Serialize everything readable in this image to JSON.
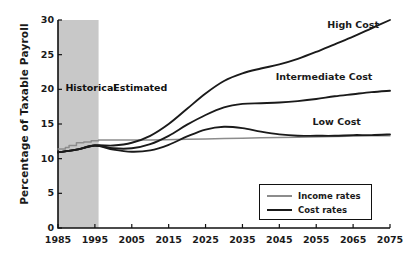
{
  "chart_data": {
    "type": "line",
    "title": "",
    "xlabel": "",
    "ylabel": "Percentage of Taxable Payroll",
    "xlim": [
      1985,
      2075
    ],
    "ylim": [
      0,
      30
    ],
    "grid": false,
    "legend_position": "bottom-right",
    "y_ticks": [
      0,
      5,
      10,
      15,
      20,
      25,
      30
    ],
    "y_tick_labels": [
      "0",
      "5",
      "10",
      "15",
      "20",
      "25",
      "30"
    ],
    "x_ticks": [
      1985,
      1995,
      2005,
      2015,
      2025,
      2035,
      2045,
      2055,
      2065,
      2075
    ],
    "x_tick_labels": [
      "1985",
      "1995",
      "2005",
      "2015",
      "2025",
      "2035",
      "2045",
      "2055",
      "2065",
      "2075"
    ],
    "annotations": [
      {
        "text": "Historical",
        "x": 1987,
        "y": 20.2
      },
      {
        "text": "Estimated",
        "x": 2000,
        "y": 20.2
      },
      {
        "text": "High Cost",
        "x": 2058,
        "y": 29.3
      },
      {
        "text": "Intermediate Cost",
        "x": 2044,
        "y": 21.8
      },
      {
        "text": "Low Cost",
        "x": 2054,
        "y": 15.3
      }
    ],
    "shaded_region": {
      "label": "Historical",
      "x_start": 1985,
      "x_end": 1996,
      "color": "#c8c8c8"
    },
    "series": [
      {
        "name": "Income rates",
        "color": "#8c8c8c",
        "x": [
          1985,
          1986,
          1987,
          1988,
          1989,
          1990,
          1991,
          1992,
          1993,
          1994,
          1995,
          1996,
          2000,
          2010,
          2020,
          2030,
          2040,
          2050,
          2060,
          2070,
          2075
        ],
        "values": [
          11.4,
          11.4,
          11.6,
          11.9,
          11.9,
          12.3,
          12.3,
          12.4,
          12.4,
          12.6,
          12.6,
          12.7,
          12.7,
          12.7,
          12.8,
          12.9,
          13.0,
          13.1,
          13.2,
          13.3,
          13.3
        ]
      },
      {
        "name": "Cost rates - High Cost",
        "color": "#1a1a1a",
        "x": [
          1985,
          1990,
          1995,
          2000,
          2005,
          2010,
          2015,
          2020,
          2025,
          2030,
          2035,
          2040,
          2045,
          2050,
          2055,
          2060,
          2065,
          2070,
          2075
        ],
        "values": [
          10.9,
          11.3,
          11.9,
          11.9,
          12.3,
          13.3,
          15.0,
          17.2,
          19.4,
          21.2,
          22.3,
          23.0,
          23.6,
          24.4,
          25.4,
          26.5,
          27.6,
          28.8,
          30.0
        ]
      },
      {
        "name": "Cost rates - Intermediate Cost",
        "color": "#1a1a1a",
        "x": [
          1985,
          1990,
          1995,
          2000,
          2005,
          2010,
          2015,
          2020,
          2025,
          2030,
          2035,
          2040,
          2045,
          2050,
          2055,
          2060,
          2065,
          2070,
          2075
        ],
        "values": [
          10.9,
          11.3,
          11.9,
          11.5,
          11.5,
          12.1,
          13.3,
          14.9,
          16.3,
          17.4,
          17.9,
          18.0,
          18.1,
          18.3,
          18.6,
          19.0,
          19.3,
          19.6,
          19.8
        ]
      },
      {
        "name": "Cost rates - Low Cost",
        "color": "#1a1a1a",
        "x": [
          1985,
          1990,
          1995,
          2000,
          2005,
          2010,
          2015,
          2020,
          2025,
          2030,
          2035,
          2040,
          2045,
          2050,
          2055,
          2060,
          2065,
          2070,
          2075
        ],
        "values": [
          10.9,
          11.3,
          11.9,
          11.3,
          11.0,
          11.2,
          12.0,
          13.2,
          14.2,
          14.6,
          14.4,
          13.9,
          13.5,
          13.3,
          13.3,
          13.3,
          13.4,
          13.4,
          13.5
        ]
      }
    ]
  },
  "legend": {
    "items": [
      {
        "label": "Income rates",
        "color": "#8c8c8c"
      },
      {
        "label": "Cost rates",
        "color": "#1a1a1a"
      }
    ]
  }
}
